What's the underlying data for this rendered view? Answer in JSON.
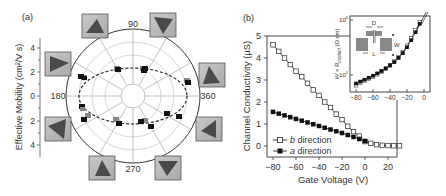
{
  "chart_data": [
    {
      "panel_label": "(a)",
      "type": "scatter",
      "subtype": "polar",
      "ylabel": "Effective Mobility (cm²/V s)",
      "y_ticks": [
        "4",
        "2",
        "0",
        "2",
        "4"
      ],
      "angle_labels": [
        "90",
        "180",
        "270",
        "360"
      ],
      "radial_range": [
        0,
        4.5
      ],
      "grid": true,
      "fit_curve": "dashed ellipse (max ~2.7 along 0/180°, ~1.8 along 90/270°)",
      "points": [
        {
          "angle": 15,
          "mobility": 2.7
        },
        {
          "angle": 60,
          "mobility": 2.1
        },
        {
          "angle": 70,
          "mobility": 2.1
        },
        {
          "angle": 110,
          "mobility": 2.1
        },
        {
          "angle": 160,
          "mobility": 2.7
        },
        {
          "angle": 165,
          "mobility": 2.7
        },
        {
          "angle": 195,
          "mobility": 2.5
        },
        {
          "angle": 205,
          "mobility": 2.6
        },
        {
          "angle": 250,
          "mobility": 2.1
        },
        {
          "angle": 290,
          "mobility": 1.9
        },
        {
          "angle": 300,
          "mobility": 2.1
        },
        {
          "angle": 330,
          "mobility": 2.0
        },
        {
          "angle": 345,
          "mobility": 2.4
        }
      ],
      "thumbnails": 8
    },
    {
      "panel_label": "(b)",
      "type": "line",
      "xlabel": "Gate Voltage (V)",
      "ylabel": "Channel Conductivity (µS)",
      "xlim": [
        -85,
        30
      ],
      "ylim": [
        -0.3,
        5
      ],
      "x_ticks": [
        "−80",
        "−60",
        "−40",
        "−20",
        "0",
        "20"
      ],
      "y_ticks": [
        "0",
        "1",
        "2",
        "3",
        "4",
        "5"
      ],
      "legend": [
        "b direction",
        "a direction"
      ],
      "legend_position": "lower left",
      "series": [
        {
          "name": "b direction",
          "marker": "open square",
          "x": [
            -80,
            -75,
            -70,
            -65,
            -60,
            -55,
            -50,
            -45,
            -40,
            -35,
            -30,
            -25,
            -20,
            -15,
            -10,
            -5,
            0,
            5,
            10,
            15,
            20,
            25,
            30
          ],
          "values": [
            4.6,
            4.3,
            4.0,
            3.7,
            3.4,
            3.15,
            2.85,
            2.55,
            2.3,
            2.0,
            1.75,
            1.45,
            1.2,
            0.9,
            0.65,
            0.45,
            0.2,
            0.12,
            0.06,
            0.03,
            0.02,
            0.01,
            0.01
          ]
        },
        {
          "name": "a direction",
          "marker": "filled square",
          "x": [
            -80,
            -75,
            -70,
            -65,
            -60,
            -55,
            -50,
            -45,
            -40,
            -35,
            -30,
            -25,
            -20,
            -15,
            -10,
            -5,
            0
          ],
          "values": [
            1.55,
            1.47,
            1.39,
            1.31,
            1.23,
            1.15,
            1.07,
            0.99,
            0.91,
            0.83,
            0.75,
            0.67,
            0.59,
            0.5,
            0.41,
            0.32,
            0.23
          ]
        }
      ],
      "inset": {
        "type": "line",
        "ylabel": "W × R_contact (Ω cm)",
        "yscale": "log",
        "y_ticks": [
          "10⁵",
          "10⁶"
        ],
        "x_ticks": [
          "−80",
          "−60",
          "−40",
          "−20",
          "0"
        ],
        "xlim": [
          -85,
          0
        ],
        "diagram_labels": [
          "D",
          "W",
          "L"
        ],
        "series": [
          {
            "name": "b direction",
            "marker": "open square",
            "x": [
              -80,
              -75,
              -70,
              -65,
              -60,
              -55,
              -50,
              -45,
              -40,
              -35,
              -30,
              -25,
              -20,
              -15,
              -10,
              -5
            ],
            "values": [
              65000,
              72000,
              78000,
              85000,
              93000,
              103000,
              115000,
              130000,
              150000,
              175000,
              210000,
              260000,
              340000,
              460000,
              650000,
              900000
            ]
          },
          {
            "name": "a direction",
            "marker": "filled square",
            "x": [
              -80,
              -75,
              -70,
              -65,
              -60,
              -55,
              -50,
              -45,
              -40,
              -35,
              -30,
              -25,
              -20,
              -15,
              -10,
              -5
            ],
            "values": [
              70000,
              76000,
              82000,
              89000,
              97000,
              107000,
              118000,
              132000,
              150000,
              172000,
              205000,
              250000,
              320000,
              430000,
              600000,
              850000
            ]
          }
        ]
      }
    }
  ],
  "labels": {
    "panel_a": "(a)",
    "panel_b": "(b)",
    "a_ylabel": "Effective Mobility (cm²/V s)",
    "b_xlabel": "Gate Voltage (V)",
    "b_ylabel": "Channel Conductivity (µS)",
    "inset_ylabel_main": "W × R",
    "inset_ylabel_sub": "contact",
    "inset_ylabel_unit": " (Ω cm)",
    "legend_b": "b direction",
    "legend_a": "a direction",
    "angle_90": "90",
    "angle_180": "180",
    "angle_270": "270",
    "angle_360": "360",
    "inset_D": "D",
    "inset_W": "W",
    "inset_L": "L"
  }
}
